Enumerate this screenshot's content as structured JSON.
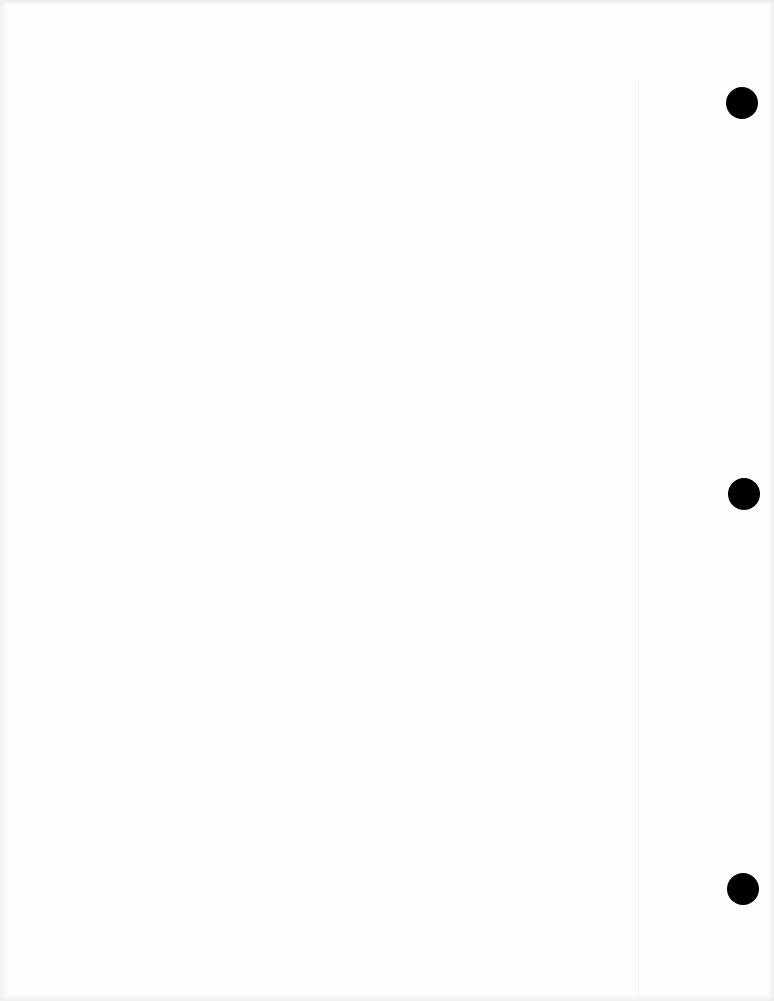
{
  "page": {
    "type": "blank scanned page",
    "background_color": "#fefefe",
    "punch_holes": [
      {
        "cx": 742,
        "cy": 103,
        "r": 16
      },
      {
        "cx": 744,
        "cy": 494,
        "r": 16
      },
      {
        "cx": 743,
        "cy": 889,
        "r": 16
      }
    ],
    "punch_hole_color": "#000000"
  }
}
